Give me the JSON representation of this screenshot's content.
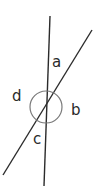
{
  "diagram": {
    "type": "intersecting-lines-angles",
    "colors": {
      "line": "#2b2b2b",
      "circle": "#7a7a7a",
      "label": "#2a2a2a",
      "background": "#ffffff"
    },
    "lines": [
      {
        "name": "near-vertical-line",
        "x1": 50,
        "y1": 16,
        "x2": 44,
        "y2": 186
      },
      {
        "name": "diagonal-line",
        "x1": 92,
        "y1": 30,
        "x2": 3,
        "y2": 175
      }
    ],
    "circle": {
      "cx": 46,
      "cy": 107,
      "r": 16
    },
    "labels": {
      "a": "a",
      "b": "b",
      "c": "c",
      "d": "d"
    }
  }
}
